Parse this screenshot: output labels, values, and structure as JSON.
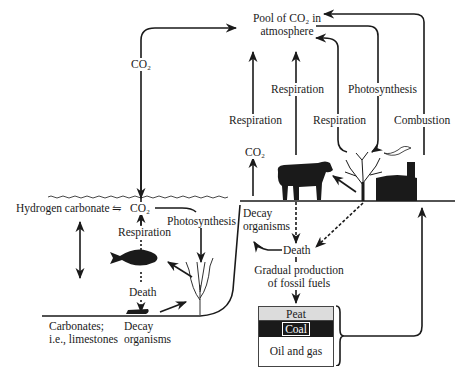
{
  "atmosphere": {
    "line1": "Pool of CO₂ in",
    "line2": "atmosphere"
  },
  "labels": {
    "co2_left": "CO₂",
    "co2_land": "CO₂",
    "respiration_land_left": "Respiration",
    "respiration_animal": "Respiration",
    "photosynthesis_land": "Photosynthesis",
    "respiration_plant": "Respiration",
    "combustion": "Combustion",
    "hydrogen_carbonate": "Hydrogen carbonate",
    "equilibrium": "⇋",
    "co2_water": "CO₂",
    "respiration_water": "Respiration",
    "photosynthesis_water": "Photosynthesis",
    "death_water": "Death",
    "carbonates_line1": "Carbonates;",
    "carbonates_line2": "i.e., limestones",
    "decay_water_line1": "Decay",
    "decay_water_line2": "organisms",
    "decay_land_line1": "Decay",
    "decay_land_line2": "organisms",
    "death_land": "Death",
    "fossil_line1": "Gradual production",
    "fossil_line2": "of fossil fuels"
  },
  "fossil_fuels": [
    "Peat",
    "Coal",
    "Oil and gas"
  ],
  "icons": [
    "cow-icon",
    "tree-icon",
    "factory-icon",
    "fish-icon",
    "seaweed-icon",
    "decay-organisms-icon"
  ],
  "colors": {
    "ink": "#1a1a1a",
    "background": "#ffffff",
    "peat": "#dcdcdc",
    "coal": "#1a1a1a"
  }
}
